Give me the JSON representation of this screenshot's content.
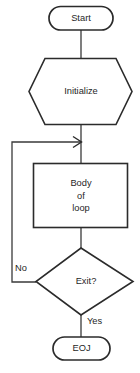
{
  "diagram": {
    "nodes": {
      "start": {
        "label": "Start",
        "shape": "terminator"
      },
      "initialize": {
        "label": "Initialize",
        "shape": "hexagon"
      },
      "body": {
        "line1": "Body",
        "line2": "of",
        "line3": "loop",
        "shape": "process"
      },
      "exit": {
        "label": "Exit?",
        "shape": "decision"
      },
      "eoj": {
        "label": "EOJ",
        "shape": "terminator"
      }
    },
    "edge_labels": {
      "no": "No",
      "yes": "Yes"
    },
    "colors": {
      "stroke": "#2b2b2b",
      "connector": "#3a3a3a",
      "fill": "#ffffff",
      "text": "#1f1f1f"
    }
  }
}
